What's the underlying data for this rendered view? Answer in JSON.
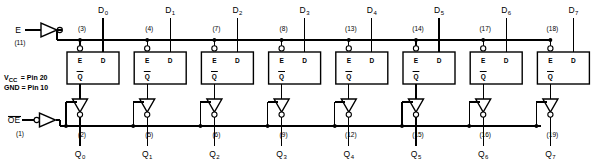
{
  "diagram": {
    "power_notes": [
      "V  = Pin 20",
      "GND = Pin 10"
    ],
    "power_notes_parts": {
      "vcc_label": "V",
      "vcc_sub": "CC",
      "vcc_rest": "= Pin 20",
      "gnd_line": "GND = Pin 10"
    },
    "control_inputs": [
      {
        "name": "enable-input",
        "label": "E",
        "sub": "",
        "pin": "(11)",
        "buffer": "inverter",
        "bubble": "output",
        "overbar": false
      },
      {
        "name": "output-enable-input",
        "label": "OE",
        "sub": "",
        "pin": "(1)",
        "buffer": "inverter",
        "bubble": "input",
        "overbar": true
      }
    ],
    "latch_ports": {
      "enable": "E",
      "data": "D",
      "output": "Q"
    },
    "bit_count": 8,
    "bits": [
      {
        "index": 0,
        "d_label": "D",
        "d_sub": "0",
        "d_pin": "(3)",
        "q_label": "Q",
        "q_sub": "0",
        "q_pin": "(2)"
      },
      {
        "index": 1,
        "d_label": "D",
        "d_sub": "1",
        "d_pin": "(4)",
        "q_label": "Q",
        "q_sub": "1",
        "q_pin": "(5)"
      },
      {
        "index": 2,
        "d_label": "D",
        "d_sub": "2",
        "d_pin": "(7)",
        "q_label": "Q",
        "q_sub": "2",
        "q_pin": "(6)"
      },
      {
        "index": 3,
        "d_label": "D",
        "d_sub": "3",
        "d_pin": "(8)",
        "q_label": "Q",
        "q_sub": "3",
        "q_pin": "(9)"
      },
      {
        "index": 4,
        "d_label": "D",
        "d_sub": "4",
        "d_pin": "(13)",
        "q_label": "Q",
        "q_sub": "4",
        "q_pin": "(12)"
      },
      {
        "index": 5,
        "d_label": "D",
        "d_sub": "5",
        "d_pin": "(14)",
        "q_label": "Q",
        "q_sub": "5",
        "q_pin": "(15)"
      },
      {
        "index": 6,
        "d_label": "D",
        "d_sub": "6",
        "d_pin": "(17)",
        "q_label": "Q",
        "q_sub": "6",
        "q_pin": "(16)"
      },
      {
        "index": 7,
        "d_label": "D",
        "d_sub": "7",
        "d_pin": "(18)",
        "q_label": "Q",
        "q_sub": "7",
        "q_pin": "(19)"
      }
    ],
    "caption": "",
    "colors": {
      "ink": "#000000",
      "background": "#ffffff"
    }
  }
}
